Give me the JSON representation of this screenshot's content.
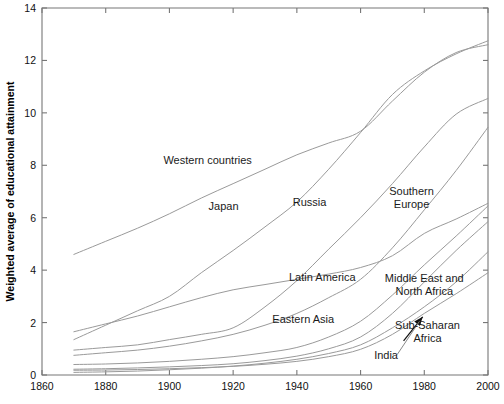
{
  "figure": {
    "background": "#ffffff",
    "width": 504,
    "height": 404
  },
  "chart_data": {
    "type": "line",
    "title": "",
    "subtitle": "",
    "xlabel": "",
    "ylabel": "Weighted average of educational attainment",
    "xlim": [
      1860,
      2000
    ],
    "ylim": [
      0,
      14
    ],
    "xticks": [
      1860,
      1880,
      1900,
      1920,
      1940,
      1960,
      1980,
      2000
    ],
    "xtick_labels": [
      "1860",
      "1880",
      "1900",
      "1920",
      "1940",
      "1960",
      "1980",
      "2000"
    ],
    "yticks": [
      0,
      2,
      4,
      6,
      8,
      10,
      12,
      14
    ],
    "ytick_labels": [
      "0",
      "2",
      "4",
      "6",
      "8",
      "10",
      "12",
      "14"
    ],
    "grid": false,
    "legend": "inline-annotations",
    "legend_position": "inline",
    "line_color": "#9a9a9a",
    "x": [
      1870,
      1880,
      1890,
      1900,
      1910,
      1920,
      1930,
      1940,
      1950,
      1960,
      1970,
      1980,
      1990,
      2000
    ],
    "series": [
      {
        "name": "Western countries",
        "label": "Western countries",
        "label_x": 1912,
        "label_y": 8.05,
        "color": "#9a9a9a",
        "values": [
          4.6,
          5.1,
          5.6,
          6.15,
          6.75,
          7.3,
          7.85,
          8.4,
          8.85,
          9.3,
          10.45,
          11.55,
          12.3,
          12.6
        ]
      },
      {
        "name": "Japan",
        "label": "Japan",
        "label_x": 1917,
        "label_y": 6.3,
        "color": "#9a9a9a",
        "values": [
          1.35,
          1.9,
          2.45,
          3.0,
          3.9,
          4.75,
          5.65,
          6.6,
          7.85,
          9.25,
          10.7,
          11.6,
          12.25,
          12.75
        ]
      },
      {
        "name": "Russia",
        "label": "Russia",
        "label_x": 1944,
        "label_y": 6.45,
        "color": "#9a9a9a",
        "values": [
          0.95,
          1.05,
          1.15,
          1.35,
          1.55,
          1.8,
          2.6,
          3.6,
          4.8,
          6.0,
          7.3,
          8.7,
          9.95,
          10.55
        ]
      },
      {
        "name": "Southern Europe",
        "label": "Southern\nEurope",
        "label_x": 1976,
        "label_y": 6.85,
        "color": "#9a9a9a",
        "values": [
          0.75,
          0.85,
          0.95,
          1.1,
          1.3,
          1.55,
          1.9,
          2.35,
          2.95,
          3.65,
          4.85,
          6.3,
          7.8,
          9.45
        ]
      },
      {
        "name": "Latin America",
        "label": "Latin America",
        "label_x": 1948,
        "label_y": 3.6,
        "color": "#9a9a9a",
        "values": [
          1.65,
          1.95,
          2.25,
          2.6,
          2.95,
          3.25,
          3.45,
          3.65,
          3.85,
          4.1,
          4.55,
          5.4,
          5.95,
          6.55
        ]
      },
      {
        "name": "Eastern Asia",
        "label": "Eastern Asia",
        "label_x": 1942,
        "label_y": 2.0,
        "color": "#9a9a9a",
        "values": [
          0.4,
          0.42,
          0.46,
          0.52,
          0.6,
          0.7,
          0.85,
          1.05,
          1.45,
          2.05,
          3.05,
          4.2,
          5.3,
          6.45
        ]
      },
      {
        "name": "Middle East and North Africa",
        "label": "Middle East and\nNorth Africa",
        "label_x": 1980,
        "label_y": 3.55,
        "color": "#9a9a9a",
        "values": [
          0.22,
          0.24,
          0.27,
          0.31,
          0.36,
          0.43,
          0.55,
          0.72,
          1.0,
          1.45,
          2.35,
          3.55,
          4.75,
          5.85
        ]
      },
      {
        "name": "Sub-Saharan Africa",
        "label": "Sub-Saharan\nAfrica",
        "label_x": 1981,
        "label_y": 1.75,
        "color": "#9a9a9a",
        "values": [
          0.18,
          0.19,
          0.21,
          0.24,
          0.28,
          0.33,
          0.41,
          0.52,
          0.7,
          0.98,
          1.55,
          2.35,
          3.1,
          3.9
        ]
      },
      {
        "name": "India",
        "label": "India",
        "label_x": 1968,
        "label_y": 0.62,
        "color": "#9a9a9a",
        "values": [
          0.1,
          0.12,
          0.15,
          0.2,
          0.26,
          0.34,
          0.45,
          0.6,
          0.82,
          1.15,
          1.8,
          2.6,
          3.55,
          4.7
        ]
      }
    ],
    "annotations": [
      {
        "name": "sub-saharan-africa-arrow",
        "from_x": 1973.5,
        "from_y": 1.3,
        "to_x": 1979.5,
        "to_y": 2.22,
        "type": "arrow"
      },
      {
        "name": "india-leader",
        "from_x": 1971.5,
        "from_y": 0.78,
        "to_x": 1978.5,
        "to_y": 2.05,
        "type": "leader"
      }
    ]
  }
}
